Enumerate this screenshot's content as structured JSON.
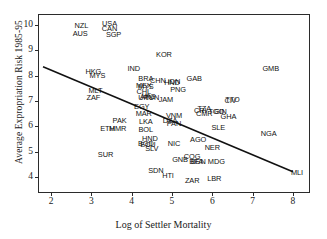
{
  "chart_data": {
    "type": "scatter",
    "title": "",
    "xlabel": "Log of Settler Mortality",
    "ylabel": "Average Expropriation Risk 1985-95",
    "xlim": [
      1.7,
      8.4
    ],
    "ylim": [
      3.4,
      10.4
    ],
    "xticks": [
      2,
      3,
      4,
      5,
      6,
      7,
      8
    ],
    "yticks": [
      4,
      5,
      6,
      7,
      8,
      9,
      10
    ],
    "grid": false,
    "legend": null,
    "point_label_field": "country ISO-3 code",
    "points": [
      {
        "label": "NZL",
        "x": 2.75,
        "y": 9.95
      },
      {
        "label": "AUS",
        "x": 2.72,
        "y": 9.65
      },
      {
        "label": "USA",
        "x": 3.45,
        "y": 10.05
      },
      {
        "label": "CAN",
        "x": 3.45,
        "y": 9.85
      },
      {
        "label": "SGP",
        "x": 3.55,
        "y": 9.6
      },
      {
        "label": "HKG",
        "x": 3.05,
        "y": 8.15
      },
      {
        "label": "MYS",
        "x": 3.15,
        "y": 8.0
      },
      {
        "label": "MLT",
        "x": 3.1,
        "y": 7.4
      },
      {
        "label": "ZAF",
        "x": 3.05,
        "y": 7.1
      },
      {
        "label": "IND",
        "x": 4.05,
        "y": 8.25
      },
      {
        "label": "KOR",
        "x": 4.8,
        "y": 8.8
      },
      {
        "label": "GMB",
        "x": 7.45,
        "y": 8.25
      },
      {
        "label": "GAB",
        "x": 5.55,
        "y": 7.85
      },
      {
        "label": "BRA",
        "x": 4.35,
        "y": 7.85
      },
      {
        "label": "CHN",
        "x": 4.65,
        "y": 7.8
      },
      {
        "label": "IDN",
        "x": 5.05,
        "y": 7.75
      },
      {
        "label": "HND",
        "x": 5.0,
        "y": 7.7
      },
      {
        "label": "MEX",
        "x": 4.3,
        "y": 7.6
      },
      {
        "label": "MYS",
        "x": 4.35,
        "y": 7.55
      },
      {
        "label": "PNG",
        "x": 5.15,
        "y": 7.45
      },
      {
        "label": "CHL",
        "x": 4.3,
        "y": 7.35
      },
      {
        "label": "ARG",
        "x": 4.4,
        "y": 7.15
      },
      {
        "label": "URY",
        "x": 4.35,
        "y": 7.1
      },
      {
        "label": "TUN",
        "x": 4.5,
        "y": 7.1
      },
      {
        "label": "JAM",
        "x": 4.85,
        "y": 7.05
      },
      {
        "label": "TTO",
        "x": 6.5,
        "y": 7.05
      },
      {
        "label": "CIV",
        "x": 6.45,
        "y": 7.0
      },
      {
        "label": "EGY",
        "x": 4.25,
        "y": 6.75
      },
      {
        "label": "TZA",
        "x": 5.8,
        "y": 6.7
      },
      {
        "label": "CRI",
        "x": 5.7,
        "y": 6.6
      },
      {
        "label": "GIN",
        "x": 6.2,
        "y": 6.55
      },
      {
        "label": "TGO",
        "x": 6.1,
        "y": 6.55
      },
      {
        "label": "CMR",
        "x": 5.8,
        "y": 6.5
      },
      {
        "label": "MAR",
        "x": 4.3,
        "y": 6.5
      },
      {
        "label": "GHA",
        "x": 6.4,
        "y": 6.35
      },
      {
        "label": "VNM",
        "x": 5.05,
        "y": 6.4
      },
      {
        "label": "DZA",
        "x": 4.95,
        "y": 6.2
      },
      {
        "label": "PAN",
        "x": 5.05,
        "y": 6.1
      },
      {
        "label": "PAK",
        "x": 3.7,
        "y": 6.2
      },
      {
        "label": "LKA",
        "x": 4.35,
        "y": 6.15
      },
      {
        "label": "ETH",
        "x": 3.4,
        "y": 5.9
      },
      {
        "label": "MMR",
        "x": 3.65,
        "y": 5.9
      },
      {
        "label": "BOL",
        "x": 4.35,
        "y": 5.85
      },
      {
        "label": "SLE",
        "x": 6.15,
        "y": 5.95
      },
      {
        "label": "NGA",
        "x": 7.4,
        "y": 5.7
      },
      {
        "label": "HND",
        "x": 4.45,
        "y": 5.5
      },
      {
        "label": "BGD",
        "x": 4.35,
        "y": 5.3
      },
      {
        "label": "ECU",
        "x": 4.4,
        "y": 5.25
      },
      {
        "label": "SLV",
        "x": 4.5,
        "y": 5.1
      },
      {
        "label": "AGO",
        "x": 5.65,
        "y": 5.45
      },
      {
        "label": "NIC",
        "x": 5.05,
        "y": 5.3
      },
      {
        "label": "NER",
        "x": 6.0,
        "y": 5.15
      },
      {
        "label": "SUR",
        "x": 3.35,
        "y": 4.85
      },
      {
        "label": "COG",
        "x": 5.5,
        "y": 4.8
      },
      {
        "label": "GNB",
        "x": 5.2,
        "y": 4.65
      },
      {
        "label": "BFA",
        "x": 5.6,
        "y": 4.6
      },
      {
        "label": "BEN",
        "x": 5.65,
        "y": 4.6
      },
      {
        "label": "MDG",
        "x": 6.1,
        "y": 4.6
      },
      {
        "label": "SDN",
        "x": 4.6,
        "y": 4.25
      },
      {
        "label": "HTI",
        "x": 4.9,
        "y": 4.05
      },
      {
        "label": "ZAR",
        "x": 5.5,
        "y": 3.85
      },
      {
        "label": "LBR",
        "x": 6.05,
        "y": 3.9
      },
      {
        "label": "MLI",
        "x": 8.1,
        "y": 4.15
      }
    ],
    "fit_line": {
      "type": "linear regression",
      "x_start": 1.8,
      "y_start": 8.35,
      "x_end": 8.0,
      "y_end": 4.2,
      "color": "#111111"
    }
  }
}
